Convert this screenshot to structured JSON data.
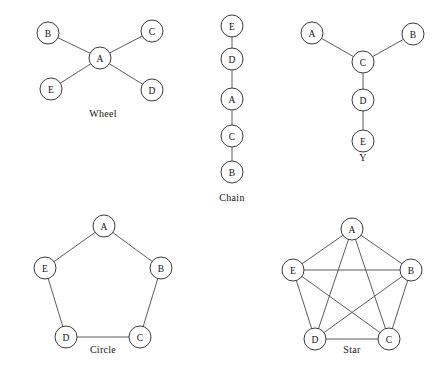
{
  "figure": {
    "width": 445,
    "height": 373,
    "background_color": "#ffffff",
    "node_stroke_color": "#3a3a3a",
    "edge_stroke_color": "#4a4a4a",
    "text_color": "#111111",
    "node_radius": 11
  },
  "diagrams": [
    {
      "id": "wheel",
      "caption": "Wheel",
      "caption_x": 103,
      "caption_y": 117,
      "nodes": [
        {
          "id": "B",
          "label": "B",
          "x": 48,
          "y": 33
        },
        {
          "id": "C",
          "label": "C",
          "x": 152,
          "y": 31
        },
        {
          "id": "A",
          "label": "A",
          "x": 100,
          "y": 58
        },
        {
          "id": "E",
          "label": "E",
          "x": 51,
          "y": 89
        },
        {
          "id": "D",
          "label": "D",
          "x": 152,
          "y": 90
        }
      ],
      "edges": [
        [
          "A",
          "B"
        ],
        [
          "A",
          "C"
        ],
        [
          "A",
          "D"
        ],
        [
          "A",
          "E"
        ]
      ]
    },
    {
      "id": "chain",
      "caption": "Chain",
      "caption_x": 232,
      "caption_y": 201,
      "nodes": [
        {
          "id": "E",
          "label": "E",
          "x": 232,
          "y": 26
        },
        {
          "id": "D",
          "label": "D",
          "x": 232,
          "y": 59
        },
        {
          "id": "A",
          "label": "A",
          "x": 232,
          "y": 99
        },
        {
          "id": "C",
          "label": "C",
          "x": 232,
          "y": 136
        },
        {
          "id": "B",
          "label": "B",
          "x": 232,
          "y": 172
        }
      ],
      "edges": [
        [
          "E",
          "D"
        ],
        [
          "D",
          "A"
        ],
        [
          "A",
          "C"
        ],
        [
          "C",
          "B"
        ]
      ]
    },
    {
      "id": "y",
      "caption": "Y",
      "caption_x": 363,
      "caption_y": 161,
      "nodes": [
        {
          "id": "A",
          "label": "A",
          "x": 312,
          "y": 33
        },
        {
          "id": "B",
          "label": "B",
          "x": 413,
          "y": 34
        },
        {
          "id": "C",
          "label": "C",
          "x": 363,
          "y": 62
        },
        {
          "id": "D",
          "label": "D",
          "x": 363,
          "y": 100
        },
        {
          "id": "E",
          "label": "E",
          "x": 363,
          "y": 141
        }
      ],
      "edges": [
        [
          "A",
          "C"
        ],
        [
          "B",
          "C"
        ],
        [
          "C",
          "D"
        ],
        [
          "D",
          "E"
        ]
      ]
    },
    {
      "id": "circle",
      "caption": "Circle",
      "caption_x": 103,
      "caption_y": 353,
      "nodes": [
        {
          "id": "A",
          "label": "A",
          "x": 104,
          "y": 226
        },
        {
          "id": "B",
          "label": "B",
          "x": 161,
          "y": 268
        },
        {
          "id": "C",
          "label": "C",
          "x": 140,
          "y": 337
        },
        {
          "id": "D",
          "label": "D",
          "x": 66,
          "y": 337
        },
        {
          "id": "E",
          "label": "E",
          "x": 45,
          "y": 268
        }
      ],
      "edges": [
        [
          "A",
          "B"
        ],
        [
          "B",
          "C"
        ],
        [
          "C",
          "D"
        ],
        [
          "D",
          "E"
        ],
        [
          "E",
          "A"
        ]
      ]
    },
    {
      "id": "star",
      "caption": "Star",
      "caption_x": 352,
      "caption_y": 353,
      "nodes": [
        {
          "id": "A",
          "label": "A",
          "x": 352,
          "y": 229
        },
        {
          "id": "B",
          "label": "B",
          "x": 411,
          "y": 270
        },
        {
          "id": "C",
          "label": "C",
          "x": 389,
          "y": 339
        },
        {
          "id": "D",
          "label": "D",
          "x": 315,
          "y": 339
        },
        {
          "id": "E",
          "label": "E",
          "x": 293,
          "y": 270
        }
      ],
      "edges": [
        [
          "A",
          "B"
        ],
        [
          "B",
          "C"
        ],
        [
          "C",
          "D"
        ],
        [
          "D",
          "E"
        ],
        [
          "E",
          "A"
        ],
        [
          "A",
          "C"
        ],
        [
          "A",
          "D"
        ],
        [
          "B",
          "D"
        ],
        [
          "B",
          "E"
        ],
        [
          "C",
          "E"
        ]
      ]
    }
  ]
}
